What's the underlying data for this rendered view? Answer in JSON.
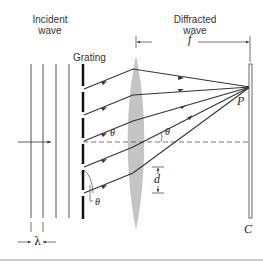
{
  "figure": {
    "labels": {
      "incident_wave": "Incident\nwave",
      "incident_line1": "Incident",
      "incident_line2": "wave",
      "grating": "Grating",
      "diffracted_line1": "Diffracted",
      "diffracted_line2": "wave",
      "focal_length": "f",
      "point": "P",
      "screen": "C",
      "slit_spacing": "d",
      "wavelength": "λ",
      "angle_top": "θ",
      "angle_right": "θ",
      "angle_bottom": "θ"
    },
    "colors": {
      "line": "#333333",
      "lens": "#bfbfbf",
      "grating": "#111111",
      "divider": "#999999"
    },
    "elements": {
      "incident_wavefronts_count": 4,
      "diffracted_rays_count": 6,
      "grating_slits_count": 5
    }
  }
}
